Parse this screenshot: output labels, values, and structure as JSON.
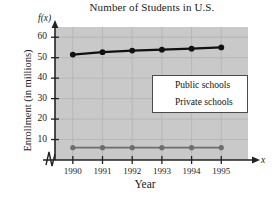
{
  "chart_data": {
    "type": "line",
    "title": "Number of Students in U.S.",
    "xlabel": "Year",
    "ylabel": "Enrollment (in millions)",
    "x_axis_variable": "x",
    "y_axis_function_label": "f(x)",
    "x": [
      1990,
      1991,
      1992,
      1993,
      1994,
      1995
    ],
    "xtick_labels": [
      "1990",
      "1991",
      "1992",
      "1993",
      "1994",
      "1995"
    ],
    "ytick_labels": [
      "10",
      "20",
      "30",
      "40",
      "50",
      "60"
    ],
    "ytick_values": [
      10,
      20,
      30,
      40,
      50,
      60
    ],
    "ylim": [
      0,
      65
    ],
    "xlim": [
      1989.4,
      1995.9
    ],
    "grid": true,
    "axis_break_x": true,
    "legend_position": "center-right",
    "plot_background": "#c9c9c9",
    "series": [
      {
        "name": "Public schools",
        "color": "#111111",
        "values": [
          51.5,
          52.7,
          53.5,
          53.9,
          54.4,
          55.0
        ]
      },
      {
        "name": "Private schools",
        "color": "#6e6e6e",
        "values": [
          6.0,
          6.0,
          6.0,
          6.0,
          6.0,
          6.0
        ]
      }
    ]
  },
  "legend": {
    "items": [
      {
        "label": "Public schools"
      },
      {
        "label": "Private schools"
      }
    ]
  }
}
